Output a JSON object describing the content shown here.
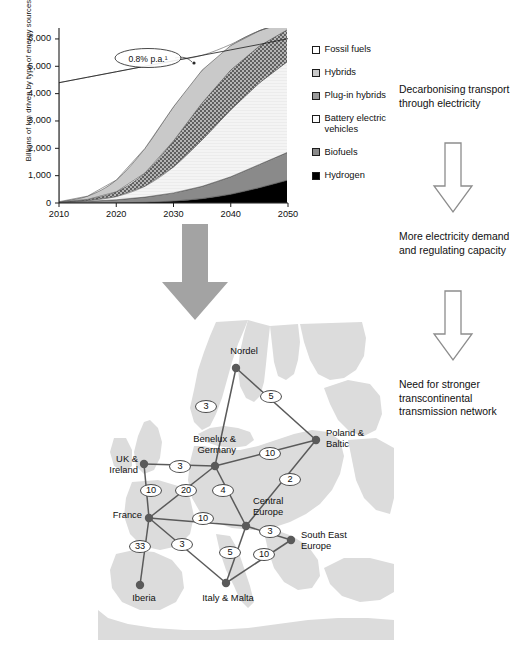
{
  "chart_data": {
    "type": "area",
    "title": "",
    "xlabel": "",
    "ylabel": "Billions of km driven by type of energy sources",
    "xlim": [
      2010,
      2050
    ],
    "ylim": [
      0,
      6400
    ],
    "xticks": [
      "2010",
      "2020",
      "2030",
      "2040",
      "2050"
    ],
    "yticks": [
      "0",
      "1,000",
      "2,000",
      "3,000",
      "4,000",
      "5,000",
      "6,000"
    ],
    "grid": false,
    "legend_position": "right",
    "annotation": "0.8% p.a.¹",
    "x": [
      2010,
      2015,
      2020,
      2025,
      2030,
      2035,
      2040,
      2045,
      2050
    ],
    "total_line": [
      4400,
      4600,
      4800,
      5000,
      5200,
      5400,
      5600,
      5800,
      6010
    ],
    "series": [
      {
        "name": "Hydrogen",
        "color": "#000000",
        "values": [
          0,
          2,
          8,
          25,
          70,
          160,
          320,
          560,
          840
        ]
      },
      {
        "name": "Biofuels",
        "color": "#8a8a8a",
        "values": [
          30,
          60,
          110,
          190,
          300,
          450,
          640,
          850,
          1020
        ]
      },
      {
        "name": "Battery electric vehicles",
        "color": "#f2f2f2",
        "values": [
          5,
          30,
          120,
          400,
          950,
          1700,
          2450,
          2980,
          3330
        ]
      },
      {
        "name": "Plug-in hybrids",
        "color": "#9a9a9a",
        "values": [
          3,
          40,
          170,
          480,
          950,
          1350,
          1450,
          1350,
          1160
        ]
      },
      {
        "name": "Hybrids",
        "color": "#c9c9c9",
        "values": [
          10,
          120,
          430,
          900,
          1250,
          1200,
          900,
          560,
          280
        ]
      },
      {
        "name": "Fossil fuels",
        "color": "#ffffff",
        "values": [
          4352,
          4348,
          3962,
          3005,
          1680,
          540,
          40,
          0,
          0
        ]
      }
    ]
  },
  "legend": {
    "items": [
      {
        "label": "Fossil fuels",
        "swatch": "sw-fossil"
      },
      {
        "label": "Hybrids",
        "swatch": "sw-hybrids"
      },
      {
        "label": "Plug-in hybrids",
        "swatch": "sw-plugin"
      },
      {
        "label": "Battery electric vehicles",
        "swatch": "sw-bev"
      },
      {
        "label": "Biofuels",
        "swatch": "sw-bio"
      },
      {
        "label": "Hydrogen",
        "swatch": "sw-h2"
      }
    ]
  },
  "flow": {
    "step1": "Decarbonising transport through electricity",
    "step2": "More electricity demand and regulating capacity",
    "step3": "Need for stronger transcontinental transmission network"
  },
  "map": {
    "nodes": [
      {
        "id": "nordel",
        "label": "Nordel",
        "x": 138,
        "y": 50,
        "lx": 116,
        "ly": 28,
        "w": 60,
        "align": "center"
      },
      {
        "id": "poland",
        "label": "Poland & Baltic",
        "x": 218,
        "y": 122,
        "lx": 228,
        "ly": 110,
        "w": 56,
        "align": "left"
      },
      {
        "id": "benelux",
        "label": "Benelux & Germany",
        "x": 117,
        "y": 148,
        "lx": 60,
        "ly": 116,
        "w": 78,
        "align": "right"
      },
      {
        "id": "ukie",
        "label": "UK & Ireland",
        "x": 46,
        "y": 146,
        "lx": -12,
        "ly": 136,
        "w": 52,
        "align": "right"
      },
      {
        "id": "france",
        "label": "France",
        "x": 51,
        "y": 200,
        "lx": -8,
        "ly": 192,
        "w": 52,
        "align": "right"
      },
      {
        "id": "central",
        "label": "Central Europe",
        "x": 148,
        "y": 208,
        "lx": 155,
        "ly": 178,
        "w": 52,
        "align": "left"
      },
      {
        "id": "see",
        "label": "South East Europe",
        "x": 193,
        "y": 222,
        "lx": 203,
        "ly": 212,
        "w": 66,
        "align": "left"
      },
      {
        "id": "iberia",
        "label": "Iberia",
        "x": 42,
        "y": 267,
        "lx": 20,
        "ly": 275,
        "w": 52,
        "align": "center"
      },
      {
        "id": "italy",
        "label": "Italy & Malta",
        "x": 128,
        "y": 265,
        "lx": 95,
        "ly": 275,
        "w": 70,
        "align": "center"
      }
    ],
    "edges": [
      {
        "from": "nordel",
        "to": "benelux",
        "value": "3",
        "lx": 108,
        "ly": 88
      },
      {
        "from": "nordel",
        "to": "poland",
        "value": "5",
        "lx": 173,
        "ly": 78
      },
      {
        "from": "benelux",
        "to": "poland",
        "value": "10",
        "lx": 172,
        "ly": 135
      },
      {
        "from": "benelux",
        "to": "ukie",
        "value": "3",
        "lx": 82,
        "ly": 148
      },
      {
        "from": "benelux",
        "to": "france",
        "value": "20",
        "lx": 88,
        "ly": 172
      },
      {
        "from": "benelux",
        "to": "central",
        "value": "4",
        "lx": 125,
        "ly": 172
      },
      {
        "from": "poland",
        "to": "central",
        "value": "2",
        "lx": 192,
        "ly": 161
      },
      {
        "from": "ukie",
        "to": "france",
        "value": "10",
        "lx": 53,
        "ly": 172
      },
      {
        "from": "france",
        "to": "central",
        "value": "10",
        "lx": 105,
        "ly": 200
      },
      {
        "from": "france",
        "to": "iberia",
        "value": "33",
        "lx": 42,
        "ly": 228
      },
      {
        "from": "france",
        "to": "italy",
        "value": "3",
        "lx": 84,
        "ly": 226
      },
      {
        "from": "central",
        "to": "italy",
        "value": "5",
        "lx": 132,
        "ly": 234
      },
      {
        "from": "central",
        "to": "see",
        "value": "3",
        "lx": 172,
        "ly": 213
      },
      {
        "from": "see",
        "to": "italy",
        "value": "10",
        "lx": 166,
        "ly": 236
      }
    ]
  }
}
